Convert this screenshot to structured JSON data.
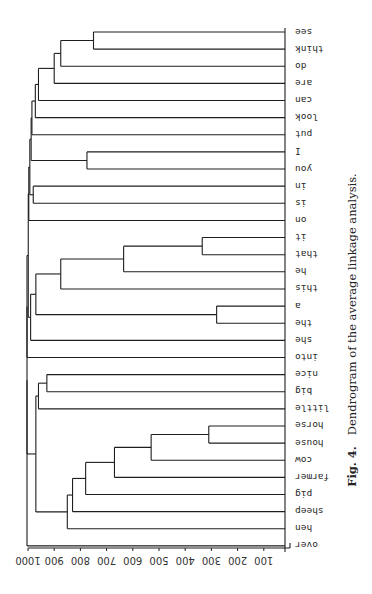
{
  "figure": {
    "caption_label": "Fig. 4.",
    "caption_text": "Dendrogram of the average linkage analysis."
  },
  "chart_data": {
    "type": "dendrogram",
    "title": "Dendrogram of the average linkage analysis.",
    "figure_label": "Fig. 4.",
    "orientation": "rotated 180 degrees (page printed sideways); distance axis at bottom, leaves at right",
    "axis": {
      "label": "",
      "ticks": [
        1000,
        900,
        800,
        700,
        600,
        500,
        400,
        300,
        200,
        100
      ],
      "range": [
        0,
        1000
      ]
    },
    "leaves": [
      "see",
      "think",
      "do",
      "are",
      "can",
      "look",
      "put",
      "I",
      "you",
      "in",
      "is",
      "on",
      "it",
      "that",
      "he",
      "this",
      "a",
      "the",
      "she",
      "into",
      "nice",
      "big",
      "little",
      "horse",
      "house",
      "cow",
      "farmer",
      "pig",
      "sheep",
      "hen",
      "over"
    ],
    "merges": [
      {
        "id": "m1",
        "children": [
          "see",
          "think"
        ],
        "height": 750
      },
      {
        "id": "m2",
        "children": [
          "m1",
          "do"
        ],
        "height": 875
      },
      {
        "id": "m3",
        "children": [
          "m2",
          "are"
        ],
        "height": 900
      },
      {
        "id": "m4",
        "children": [
          "m3",
          "can"
        ],
        "height": 960
      },
      {
        "id": "m5",
        "children": [
          "m4",
          "look"
        ],
        "height": 972
      },
      {
        "id": "m6",
        "children": [
          "m5",
          "put"
        ],
        "height": 985
      },
      {
        "id": "m7",
        "children": [
          "I",
          "you"
        ],
        "height": 775
      },
      {
        "id": "m8",
        "children": [
          "m6",
          "m7"
        ],
        "height": 988
      },
      {
        "id": "m9",
        "children": [
          "in",
          "is"
        ],
        "height": 980
      },
      {
        "id": "m10",
        "children": [
          "m8",
          "m9"
        ],
        "height": 993
      },
      {
        "id": "m11",
        "children": [
          "m10",
          "on"
        ],
        "height": 997
      },
      {
        "id": "m12",
        "children": [
          "it",
          "that"
        ],
        "height": 335
      },
      {
        "id": "m13",
        "children": [
          "m12",
          "he"
        ],
        "height": 635
      },
      {
        "id": "m14",
        "children": [
          "m13",
          "this"
        ],
        "height": 875
      },
      {
        "id": "m15",
        "children": [
          "a",
          "the"
        ],
        "height": 280
      },
      {
        "id": "m16",
        "children": [
          "m14",
          "m15"
        ],
        "height": 970
      },
      {
        "id": "m17",
        "children": [
          "m16",
          "she"
        ],
        "height": 990
      },
      {
        "id": "m18",
        "children": [
          "m11",
          "m17"
        ],
        "height": 999
      },
      {
        "id": "m19",
        "children": [
          "nice",
          "big"
        ],
        "height": 928
      },
      {
        "id": "m20",
        "children": [
          "m19",
          "little"
        ],
        "height": 960
      },
      {
        "id": "m21",
        "children": [
          "horse",
          "house"
        ],
        "height": 310
      },
      {
        "id": "m22",
        "children": [
          "m21",
          "cow"
        ],
        "height": 530
      },
      {
        "id": "m23",
        "children": [
          "m22",
          "farmer"
        ],
        "height": 670
      },
      {
        "id": "m24",
        "children": [
          "m23",
          "pig"
        ],
        "height": 780
      },
      {
        "id": "m25",
        "children": [
          "m24",
          "sheep"
        ],
        "height": 830
      },
      {
        "id": "m26",
        "children": [
          "m25",
          "hen"
        ],
        "height": 850
      },
      {
        "id": "m27",
        "children": [
          "m20",
          "m26"
        ],
        "height": 970
      },
      {
        "id": "m28",
        "children": [
          "m18",
          "into"
        ],
        "height": 1000
      },
      {
        "id": "m29",
        "children": [
          "m28",
          "m27"
        ],
        "height": 1000
      },
      {
        "id": "m30",
        "children": [
          "m29",
          "over"
        ],
        "height": 1000
      }
    ]
  },
  "layout": {
    "x_at_0": 290,
    "x_at_1000": 28,
    "leaf_x_end": 285,
    "first_leaf_y": 32,
    "leaf_spacing": 17.13,
    "axis_y": 548,
    "label_x": 292,
    "line_color": "#1e1e1e"
  }
}
